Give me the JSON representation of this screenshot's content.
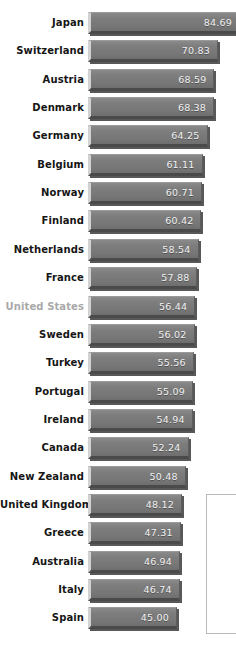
{
  "chart_data": {
    "type": "bar",
    "orientation": "horizontal",
    "title": "",
    "subtitle": "",
    "xlabel": "",
    "ylabel": "",
    "grid": false,
    "legend": null,
    "value_label_format": "2-decimal",
    "sorted": "descending",
    "xlim": [
      0,
      90
    ],
    "categories": [
      "Japan",
      "Switzerland",
      "Austria",
      "Denmark",
      "Germany",
      "Belgium",
      "Norway",
      "Finland",
      "Netherlands",
      "France",
      "United States",
      "Sweden",
      "Turkey",
      "Portugal",
      "Ireland",
      "Canada",
      "New Zealand",
      "United Kingdom",
      "Greece",
      "Australia",
      "Italy",
      "Spain"
    ],
    "values": [
      84.69,
      70.83,
      68.59,
      68.38,
      64.25,
      61.11,
      60.71,
      60.42,
      58.54,
      57.88,
      56.44,
      56.02,
      55.56,
      55.09,
      54.94,
      52.24,
      50.48,
      48.12,
      47.31,
      46.94,
      46.74,
      45.0
    ],
    "value_labels": [
      "84.69",
      "70.83",
      "68.59",
      "68.38",
      "64.25",
      "61.11",
      "60.71",
      "60.42",
      "58.54",
      "57.88",
      "56.44",
      "56.02",
      "55.56",
      "55.09",
      "54.94",
      "52.24",
      "50.48",
      "48.12",
      "47.31",
      "46.94",
      "46.74",
      "45.00"
    ],
    "highlighted_categories": [
      "United States"
    ],
    "colors": {
      "bar_fill": "#787878",
      "bar_highlight_edge": "#d2d2d2",
      "bar_shadow": "#4a4a4a",
      "value_text": "#f2f2f2",
      "label_text": "#161616",
      "label_text_muted": "#a9a9a9",
      "background": "#ffffff",
      "panel_border": "#b9b9b9"
    }
  },
  "side_panel": {
    "label": ""
  }
}
